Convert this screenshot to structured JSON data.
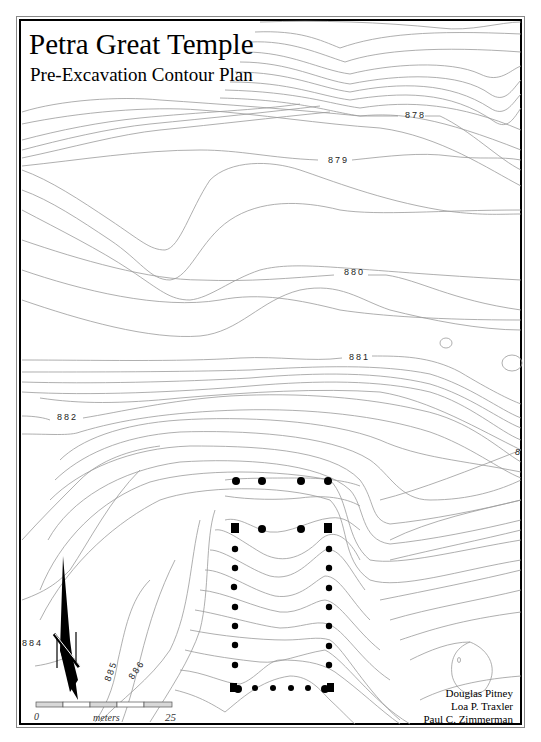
{
  "title": "Petra Great Temple",
  "subtitle": "Pre-Excavation Contour Plan",
  "contour_labels": [
    {
      "text": "878",
      "x": 405,
      "y": 118
    },
    {
      "text": "879",
      "x": 328,
      "y": 163
    },
    {
      "text": "880",
      "x": 344,
      "y": 275
    },
    {
      "text": "881",
      "x": 349,
      "y": 360
    },
    {
      "text": "882",
      "x": 57,
      "y": 420
    },
    {
      "text": "884",
      "x": 22,
      "y": 646
    },
    {
      "text": "885",
      "x": 110,
      "y": 682
    },
    {
      "text": "886",
      "x": 133,
      "y": 680
    },
    {
      "text": "8",
      "x": 515,
      "y": 455
    }
  ],
  "scale_bar": {
    "start_label": "0",
    "unit_label": "meters",
    "end_label": "25"
  },
  "credits": [
    "Douglas Pitney",
    "Loa P. Traxler",
    "Paul C. Zimmerman"
  ],
  "colors": {
    "contour": "#9a9a9a",
    "frame": "#000000",
    "columns": "#000000"
  }
}
